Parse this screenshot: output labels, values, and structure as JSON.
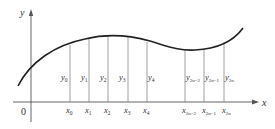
{
  "diagram": {
    "type": "function-partition",
    "axes": {
      "x_label": "x",
      "y_label": "y",
      "origin_label": "0"
    },
    "colors": {
      "curve": "#222222",
      "axis": "#555555",
      "ordinate": "#888888",
      "text": "#333333"
    },
    "partition_points": [
      {
        "x_label": "x",
        "x_sub": "0",
        "y_label": "y",
        "y_sub": "0"
      },
      {
        "x_label": "x",
        "x_sub": "1",
        "y_label": "y",
        "y_sub": "1"
      },
      {
        "x_label": "x",
        "x_sub": "2",
        "y_label": "y",
        "y_sub": "2"
      },
      {
        "x_label": "x",
        "x_sub": "3",
        "y_label": "y",
        "y_sub": "3"
      },
      {
        "x_label": "x",
        "x_sub": "4",
        "y_label": "y",
        "y_sub": "4"
      },
      {
        "x_label": "x",
        "x_sub": "2n−2",
        "y_label": "y",
        "y_sub": "2n−2"
      },
      {
        "x_label": "x",
        "x_sub": "2n−1",
        "y_label": "y",
        "y_sub": "2n−1"
      },
      {
        "x_label": "x",
        "x_sub": "2n",
        "y_label": "y",
        "y_sub": "2n"
      }
    ]
  }
}
